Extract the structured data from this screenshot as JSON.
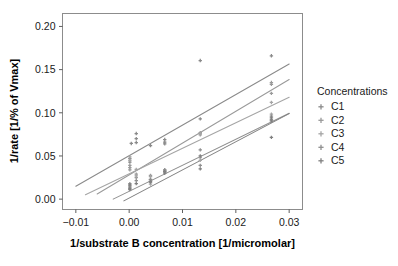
{
  "chart_data": {
    "type": "scatter",
    "title": "",
    "subtitle": "",
    "xlabel": "1/substrate B concentration [1/micromolar]",
    "ylabel": "1/rate [1/% of Vmax]",
    "xlim": [
      -0.0125,
      0.0325
    ],
    "ylim": [
      -0.012,
      0.215
    ],
    "xticks": [
      -0.01,
      0.0,
      0.01,
      0.02,
      0.03
    ],
    "xtick_labels": [
      "-0.01",
      "0.00",
      "0.01",
      "0.02",
      "0.03"
    ],
    "yticks": [
      0.0,
      0.05,
      0.1,
      0.15,
      0.2
    ],
    "ytick_labels": [
      "0.00",
      "0.05",
      "0.10",
      "0.15",
      "0.20"
    ],
    "grid": false,
    "legend_position": "right",
    "legend_title": "Concentrations",
    "marker": "plus",
    "series": [
      {
        "name": "C1",
        "color": "#8a8a8a",
        "fit_line": {
          "x_start": -0.01,
          "x_end": 0.03,
          "y_start": 0.015,
          "y_end": 0.1565,
          "slope": 3.5375,
          "intercept": 0.05038
        },
        "points": [
          {
            "x": 0.00013,
            "y": 0.0468
          },
          {
            "x": 0.00013,
            "y": 0.043
          },
          {
            "x": 0.0004,
            "y": 0.0645
          },
          {
            "x": 0.00133,
            "y": 0.076
          },
          {
            "x": 0.00133,
            "y": 0.07
          },
          {
            "x": 0.00133,
            "y": 0.0655
          },
          {
            "x": 0.004,
            "y": 0.062
          },
          {
            "x": 0.00667,
            "y": 0.069
          },
          {
            "x": 0.00667,
            "y": 0.066
          },
          {
            "x": 0.00667,
            "y": 0.064
          },
          {
            "x": 0.01333,
            "y": 0.1605
          },
          {
            "x": 0.01333,
            "y": 0.093
          },
          {
            "x": 0.02667,
            "y": 0.166
          }
        ]
      },
      {
        "name": "C2",
        "color": "#9a9a9a",
        "fit_line": {
          "x_start": -0.006,
          "x_end": 0.03,
          "y_start": 0.006,
          "y_end": 0.1385,
          "slope": 3.6806,
          "intercept": 0.02808
        },
        "points": [
          {
            "x": 0.00013,
            "y": 0.039
          },
          {
            "x": 0.00013,
            "y": 0.0365
          },
          {
            "x": 0.00013,
            "y": 0.034
          },
          {
            "x": 0.00133,
            "y": 0.029
          },
          {
            "x": 0.00133,
            "y": 0.025
          },
          {
            "x": 0.004,
            "y": 0.0275
          },
          {
            "x": 0.004,
            "y": 0.023
          },
          {
            "x": 0.00667,
            "y": 0.0335
          },
          {
            "x": 0.01333,
            "y": 0.077
          },
          {
            "x": 0.01333,
            "y": 0.0745
          },
          {
            "x": 0.02667,
            "y": 0.135
          },
          {
            "x": 0.02667,
            "y": 0.133
          },
          {
            "x": 0.02667,
            "y": 0.1225
          }
        ]
      },
      {
        "name": "C3",
        "color": "#a5a5a5",
        "fit_line": {
          "x_start": -0.0082,
          "x_end": 0.03,
          "y_start": 0.005,
          "y_end": 0.118,
          "slope": 2.9581,
          "intercept": 0.02926
        },
        "points": [
          {
            "x": 0.00013,
            "y": 0.049
          },
          {
            "x": 0.00013,
            "y": 0.045
          },
          {
            "x": 0.00133,
            "y": 0.0345
          },
          {
            "x": 0.00133,
            "y": 0.027
          },
          {
            "x": 0.004,
            "y": 0.026
          },
          {
            "x": 0.004,
            "y": 0.0175
          },
          {
            "x": 0.00667,
            "y": 0.033
          },
          {
            "x": 0.01333,
            "y": 0.076
          },
          {
            "x": 0.01333,
            "y": 0.048
          },
          {
            "x": 0.01333,
            "y": 0.045
          },
          {
            "x": 0.02667,
            "y": 0.112
          },
          {
            "x": 0.02667,
            "y": 0.0985
          }
        ]
      },
      {
        "name": "C4",
        "color": "#8f8f8f",
        "fit_line": {
          "x_start": -0.003,
          "x_end": 0.03,
          "y_start": 0.0,
          "y_end": 0.0995,
          "slope": 3.0152,
          "intercept": 0.00905
        },
        "points": [
          {
            "x": 0.00013,
            "y": 0.018
          },
          {
            "x": 0.00013,
            "y": 0.0155
          },
          {
            "x": 0.00013,
            "y": 0.014
          },
          {
            "x": 0.00133,
            "y": 0.0215
          },
          {
            "x": 0.004,
            "y": 0.0225
          },
          {
            "x": 0.004,
            "y": 0.0195
          },
          {
            "x": 0.00667,
            "y": 0.034
          },
          {
            "x": 0.00667,
            "y": 0.0315
          },
          {
            "x": 0.01333,
            "y": 0.057
          },
          {
            "x": 0.01333,
            "y": 0.039
          },
          {
            "x": 0.02667,
            "y": 0.096
          },
          {
            "x": 0.02667,
            "y": 0.092
          }
        ]
      },
      {
        "name": "C5",
        "color": "#808080",
        "fit_line": {
          "x_start": -0.001,
          "x_end": 0.03,
          "y_start": -0.002,
          "y_end": 0.099,
          "slope": 3.2581,
          "intercept": 0.00126
        },
        "points": [
          {
            "x": 0.00013,
            "y": 0.0165
          },
          {
            "x": 0.00013,
            "y": 0.0125
          },
          {
            "x": 0.00013,
            "y": 0.011
          },
          {
            "x": 0.00133,
            "y": 0.018
          },
          {
            "x": 0.004,
            "y": 0.0205
          },
          {
            "x": 0.00667,
            "y": 0.032
          },
          {
            "x": 0.00667,
            "y": 0.03
          },
          {
            "x": 0.01333,
            "y": 0.05
          },
          {
            "x": 0.01333,
            "y": 0.035
          },
          {
            "x": 0.02667,
            "y": 0.094
          },
          {
            "x": 0.02667,
            "y": 0.0905
          },
          {
            "x": 0.02667,
            "y": 0.0715
          }
        ]
      }
    ]
  },
  "legend": {
    "title": "Concentrations",
    "items": [
      {
        "label": "C1",
        "color": "#8a8a8a"
      },
      {
        "label": "C2",
        "color": "#9a9a9a"
      },
      {
        "label": "C3",
        "color": "#a5a5a5"
      },
      {
        "label": "C4",
        "color": "#8f8f8f"
      },
      {
        "label": "C5",
        "color": "#808080"
      }
    ]
  },
  "axes": {
    "x_title": "1/substrate B concentration [1/micromolar]",
    "y_title": "1/rate [1/% of Vmax]",
    "x_ticks": [
      "-0.01",
      "0.00",
      "0.01",
      "0.02",
      "0.03"
    ],
    "y_ticks": [
      "0.00",
      "0.05",
      "0.10",
      "0.15",
      "0.20"
    ]
  },
  "colors": {
    "panel_border": "#8c8c8c",
    "tick": "#4d4d4d",
    "text": "#1a1a1a",
    "background": "#ffffff"
  }
}
